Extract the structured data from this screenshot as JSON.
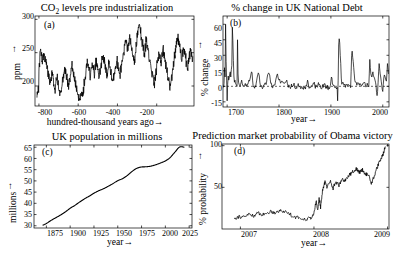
{
  "figure": {
    "background": "#ffffff",
    "line_color": "#000000",
    "panels": 4
  },
  "chart_data": [
    {
      "id": "a",
      "panel_label": "(a)",
      "type": "line",
      "title": "CO2 levels pre industrialization",
      "title_html": "CO<sub>2</sub> levels pre industrialization",
      "xlabel": "hundred-thousand years ago→",
      "ylabel": "ppm ↑",
      "ylabel_plain": "ppm",
      "xlim": [
        -820,
        -10
      ],
      "ylim": [
        170,
        305
      ],
      "xticks": [
        -800,
        -600,
        -400,
        -200
      ],
      "xticklabels": [
        "-800",
        "-600",
        "-400",
        "-200"
      ],
      "yticks": [
        200,
        250,
        300
      ],
      "yticklabels": [
        "200",
        "250",
        "300"
      ],
      "grid": false,
      "legend": false,
      "x": [
        -810,
        -805,
        -800,
        -795,
        -790,
        -785,
        -780,
        -775,
        -770,
        -765,
        -760,
        -755,
        -750,
        -745,
        -740,
        -735,
        -730,
        -725,
        -720,
        -715,
        -710,
        -705,
        -700,
        -695,
        -690,
        -685,
        -680,
        -675,
        -670,
        -665,
        -660,
        -655,
        -650,
        -645,
        -640,
        -635,
        -630,
        -625,
        -620,
        -615,
        -610,
        -605,
        -600,
        -595,
        -590,
        -585,
        -580,
        -575,
        -570,
        -565,
        -560,
        -555,
        -550,
        -545,
        -540,
        -535,
        -530,
        -525,
        -520,
        -515,
        -510,
        -505,
        -500,
        -495,
        -490,
        -485,
        -480,
        -475,
        -470,
        -465,
        -460,
        -455,
        -450,
        -445,
        -440,
        -435,
        -430,
        -425,
        -420,
        -415,
        -410,
        -405,
        -400,
        -395,
        -390,
        -385,
        -380,
        -375,
        -370,
        -365,
        -360,
        -355,
        -350,
        -345,
        -340,
        -335,
        -330,
        -325,
        -320,
        -315,
        -310,
        -305,
        -300,
        -295,
        -290,
        -285,
        -280,
        -275,
        -270,
        -265,
        -260,
        -255,
        -250,
        -245,
        -240,
        -235,
        -230,
        -225,
        -220,
        -215,
        -210,
        -205,
        -200,
        -195,
        -190,
        -185,
        -180,
        -175,
        -170,
        -165,
        -160,
        -155,
        -150,
        -145,
        -140,
        -135,
        -130,
        -125,
        -120,
        -115,
        -110,
        -105,
        -100,
        -95,
        -90,
        -85,
        -80,
        -75,
        -70,
        -65,
        -60,
        -55,
        -50,
        -45,
        -40,
        -35,
        -30,
        -25,
        -20
      ],
      "y": [
        186,
        196,
        228,
        252,
        246,
        238,
        243,
        249,
        241,
        235,
        228,
        218,
        212,
        205,
        214,
        220,
        213,
        198,
        191,
        207,
        214,
        205,
        196,
        189,
        193,
        200,
        209,
        217,
        224,
        219,
        212,
        205,
        198,
        210,
        223,
        231,
        226,
        219,
        211,
        203,
        196,
        190,
        184,
        178,
        183,
        191,
        185,
        192,
        205,
        216,
        228,
        236,
        230,
        222,
        215,
        224,
        233,
        226,
        218,
        227,
        236,
        229,
        221,
        214,
        222,
        231,
        240,
        247,
        239,
        231,
        224,
        216,
        226,
        235,
        228,
        220,
        212,
        205,
        213,
        222,
        230,
        239,
        232,
        224,
        217,
        225,
        234,
        243,
        252,
        261,
        270,
        264,
        256,
        262,
        271,
        266,
        258,
        250,
        243,
        236,
        250,
        264,
        277,
        288,
        293,
        284,
        274,
        265,
        256,
        248,
        258,
        268,
        259,
        250,
        242,
        234,
        226,
        218,
        210,
        202,
        212,
        222,
        232,
        242,
        252,
        244,
        236,
        245,
        255,
        247,
        239,
        231,
        223,
        215,
        207,
        199,
        205,
        214,
        224,
        234,
        245,
        256,
        267,
        274,
        266,
        258,
        250,
        242,
        250,
        259,
        251,
        243,
        235,
        227,
        236,
        246,
        256,
        249,
        241,
        233,
        225,
        217,
        210,
        203,
        196,
        189,
        197,
        207,
        218,
        230,
        242,
        254,
        266,
        258,
        250,
        242,
        234,
        226,
        218,
        210,
        221,
        233,
        245,
        257,
        269,
        262,
        254,
        246,
        238,
        230,
        222,
        214,
        206,
        214,
        224,
        236,
        248,
        260,
        272,
        264,
        256,
        248,
        240,
        232,
        224,
        216,
        208,
        200,
        192,
        200,
        212,
        225,
        238,
        250,
        262,
        274,
        266,
        258,
        250,
        242,
        234,
        226,
        218,
        228,
        240,
        252,
        264,
        276,
        268,
        260,
        252,
        244,
        236,
        228,
        220,
        212,
        204,
        196,
        188,
        196,
        208,
        220,
        232,
        244,
        256,
        268,
        280,
        272,
        264,
        256,
        248,
        240,
        232,
        224,
        216,
        208,
        200,
        192,
        184,
        192,
        204,
        216,
        228,
        240,
        252,
        264,
        276,
        268,
        260,
        252,
        244,
        236,
        228,
        220,
        212,
        204,
        196,
        188,
        196,
        208,
        220,
        232,
        244,
        256,
        268,
        280,
        272,
        264,
        256,
        248,
        240
      ]
    },
    {
      "id": "b",
      "panel_label": "(b)",
      "type": "line",
      "title": "% change in UK National Debt",
      "xlabel": "year→",
      "ylabel": "% change ↑",
      "ylabel_plain": "% change",
      "xlim": [
        1692,
        2012
      ],
      "ylim": [
        -20,
        68
      ],
      "xticks": [
        1700,
        1800,
        1900,
        2000
      ],
      "xticklabels": [
        "1700",
        "1800",
        "1900",
        "2000"
      ],
      "yticks": [
        -15,
        0,
        15,
        30,
        45,
        60
      ],
      "yticklabels": [
        "-15",
        "0",
        "15",
        "30",
        "45",
        "60"
      ],
      "zero_line": 0,
      "grid": false,
      "legend": false
    },
    {
      "id": "c",
      "panel_label": "(c)",
      "type": "line",
      "title": "UK population in millions",
      "xlabel": "year→",
      "ylabel": "millions→",
      "ylabel_plain": "millions",
      "xlim": [
        1862,
        2028
      ],
      "ylim": [
        29,
        66
      ],
      "xticks": [
        1875,
        1900,
        1925,
        1950,
        1975,
        2000,
        2025
      ],
      "xticklabels": [
        "1875",
        "1900",
        "1925",
        "1950",
        "1975",
        "2000",
        "2025"
      ],
      "yticks": [
        30,
        35,
        40,
        45,
        50,
        55,
        60,
        65
      ],
      "yticklabels": [
        "30",
        "35",
        "40",
        "45",
        "50",
        "55",
        "60",
        "65"
      ],
      "grid": false,
      "legend": false,
      "x": [
        1871,
        1875,
        1880,
        1885,
        1890,
        1895,
        1900,
        1905,
        1910,
        1915,
        1920,
        1925,
        1930,
        1935,
        1940,
        1945,
        1950,
        1955,
        1960,
        1965,
        1970,
        1975,
        1980,
        1985,
        1990,
        1995,
        2000,
        2005,
        2010,
        2015,
        2020
      ],
      "y": [
        30.2,
        31.0,
        32.4,
        33.6,
        34.8,
        36.2,
        37.8,
        39.1,
        40.6,
        42.0,
        43.2,
        44.5,
        45.6,
        46.5,
        47.6,
        48.8,
        50.1,
        51.0,
        52.4,
        54.2,
        55.6,
        56.2,
        56.3,
        56.6,
        57.2,
        58.0,
        58.9,
        60.4,
        62.8,
        65.1,
        65.0
      ]
    },
    {
      "id": "d",
      "panel_label": "(d)",
      "type": "line",
      "title": "Prediction market probability of Obama victory",
      "xlabel": "year→",
      "ylabel": "% probability ↑",
      "ylabel_plain": "% probability",
      "xlim": [
        2006.75,
        2009.02
      ],
      "ylim": [
        0,
        102
      ],
      "xticks": [
        2007,
        2008,
        2009
      ],
      "xticklabels": [
        "2007",
        "2008",
        "2009"
      ],
      "yticks": [
        50,
        100
      ],
      "yticklabels": [
        "50",
        "100"
      ],
      "grid": false,
      "legend": false
    }
  ]
}
